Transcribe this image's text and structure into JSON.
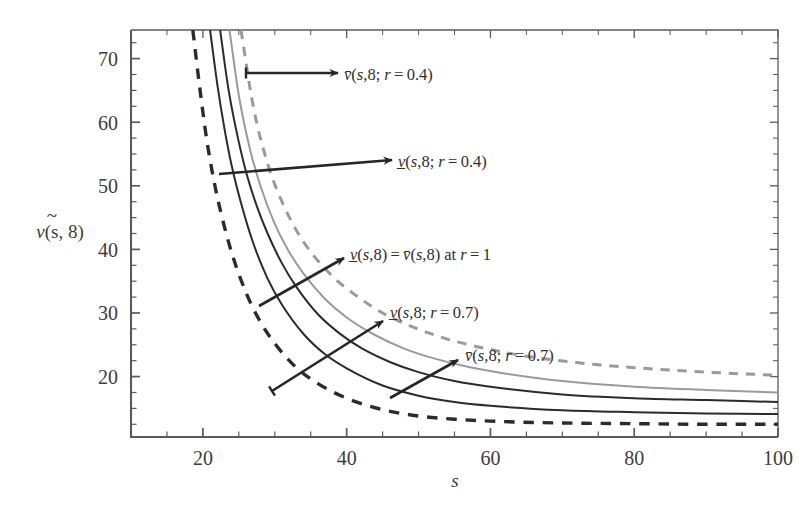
{
  "figure": {
    "background": "#ffffff",
    "frame_color": "#5a5a5a",
    "title": ""
  },
  "axes": {
    "x": {
      "label": "s",
      "min": 10,
      "max": 100,
      "ticks": [
        20,
        40,
        60,
        80,
        100
      ],
      "tick_labels": [
        "20",
        "40",
        "60",
        "80",
        "100"
      ],
      "minor_step": 5
    },
    "y": {
      "label_parts": {
        "sym": "v",
        "accent": "~",
        "args": "(s, 8)"
      },
      "label": "ṽ(s, 8)",
      "min": 10.5,
      "max": 74.5,
      "ticks": [
        20,
        30,
        40,
        50,
        60,
        70
      ],
      "tick_labels": [
        "20",
        "30",
        "40",
        "50",
        "60",
        "70"
      ],
      "minor_step": 2.5
    }
  },
  "colors": {
    "black": "#2b2b2b",
    "gray": "#9a9a9a",
    "frame": "#5a5a5a",
    "text": "#333333",
    "arrow": "#262626"
  },
  "chart_data": {
    "type": "line",
    "title": "",
    "xlabel": "s",
    "ylabel": "ṽ(s, 8)",
    "xlim": [
      10,
      100
    ],
    "ylim": [
      10.5,
      74.5
    ],
    "grid": false,
    "legend": "annotations",
    "series": [
      {
        "name": "v_lower(s,8; r=0.4)",
        "label": "v̲(s,8; r=0.4)",
        "style": "dashed",
        "color": "#2b2b2b",
        "width": 3.4,
        "asymptote": 12.4,
        "x_at_top": 18.6,
        "x": [
          18.6,
          19.5,
          20.5,
          21.5,
          22.5,
          24,
          26,
          28,
          30,
          33,
          36,
          40,
          45,
          50,
          55,
          60,
          70,
          80,
          90,
          100
        ],
        "y": [
          74.5,
          66.0,
          57.5,
          51.0,
          45.8,
          39.5,
          33.2,
          28.6,
          25.2,
          21.4,
          18.9,
          16.6,
          14.8,
          13.8,
          13.3,
          13.0,
          12.7,
          12.6,
          12.5,
          12.5
        ]
      },
      {
        "name": "v_lower(s,8; r=0.7)",
        "label": "v̲(s,8; r=0.7)",
        "style": "solid",
        "color": "#2b2b2b",
        "width": 2.0,
        "asymptote": 13.8,
        "x_at_top": 21.0,
        "x": [
          21.0,
          22.0,
          23.0,
          24.0,
          25.5,
          27,
          29,
          31,
          34,
          37,
          40,
          45,
          50,
          55,
          60,
          70,
          80,
          90,
          100
        ],
        "y": [
          74.5,
          66.0,
          59.0,
          53.2,
          46.5,
          41.0,
          35.4,
          31.3,
          26.7,
          23.5,
          21.3,
          18.6,
          17.0,
          16.0,
          15.4,
          14.7,
          14.4,
          14.2,
          14.1
        ]
      },
      {
        "name": "v_lower(s,8)=v_upper(s,8) at r=1",
        "label": "v̲(s,8) = v̄(s,8) at r = 1",
        "style": "solid",
        "color": "#2b2b2b",
        "width": 2.0,
        "asymptote": 14.7,
        "x_at_top": 22.4,
        "x": [
          22.4,
          23.5,
          24.5,
          26,
          27.5,
          29,
          31,
          33,
          36,
          39,
          42,
          46,
          50,
          55,
          60,
          70,
          80,
          90,
          100
        ],
        "y": [
          74.5,
          65.6,
          59.5,
          52.2,
          46.8,
          42.5,
          37.8,
          34.1,
          29.8,
          26.8,
          24.5,
          22.3,
          20.7,
          19.3,
          18.4,
          17.2,
          16.6,
          16.3,
          16.0
        ]
      },
      {
        "name": "v_upper(s,8; r=0.7)",
        "label": "v̄(s,8; r=0.7)",
        "style": "solid",
        "color": "#9a9a9a",
        "width": 2.0,
        "asymptote": 15.6,
        "x_at_top": 23.7,
        "x": [
          23.7,
          25,
          26.5,
          28,
          30,
          32,
          34,
          37,
          40,
          44,
          48,
          52,
          57,
          62,
          70,
          80,
          90,
          100
        ],
        "y": [
          74.5,
          64.2,
          56.0,
          50.0,
          44.0,
          39.6,
          36.2,
          32.2,
          29.3,
          26.5,
          24.4,
          22.9,
          21.5,
          20.5,
          19.3,
          18.4,
          17.9,
          17.5
        ]
      },
      {
        "name": "v_upper(s,8; r=0.4)",
        "label": "v̄(s,8; r=0.4)",
        "style": "dashed",
        "color": "#9a9a9a",
        "width": 3.0,
        "asymptote": 17.2,
        "x_at_top": 25.3,
        "x": [
          25.3,
          27,
          29,
          31,
          33,
          35,
          38,
          41,
          45,
          49,
          54,
          59,
          65,
          72,
          80,
          90,
          100
        ],
        "y": [
          74.5,
          62.5,
          53.5,
          47.5,
          43.0,
          39.6,
          35.8,
          33.0,
          30.0,
          27.9,
          25.9,
          24.5,
          23.2,
          22.2,
          21.4,
          20.7,
          20.2
        ]
      }
    ]
  },
  "annotations": [
    {
      "id": "ann-vbar-04",
      "text_html": "<tspan class='it'>v̄</tspan>(<tspan class='it'>s</tspan>,8; <tspan class='it'>r</tspan> = 0.4)",
      "text": "v̄(s,8; r=0.4)",
      "label_x": 344,
      "label_y": 80,
      "arrow": {
        "x1": 246,
        "y1": 73,
        "x2": 338,
        "y2": 73,
        "tail_tick": true
      }
    },
    {
      "id": "ann-vlow-04",
      "text_html": "<tspan class='it'>v̲</tspan>(<tspan class='it'>s</tspan>,8; <tspan class='it'>r</tspan> = 0.4)",
      "text": "v̲(s,8; r=0.4)",
      "label_x": 398,
      "label_y": 167,
      "arrow": {
        "x1": 219,
        "y1": 174,
        "x2": 392,
        "y2": 160,
        "tail_tick": false
      }
    },
    {
      "id": "ann-equal-r1",
      "text_html": "<tspan class='it'>v̲</tspan>(<tspan class='it'>s</tspan>,8) = <tspan class='it'>v̄</tspan>(<tspan class='it'>s</tspan>,8) at <tspan class='it'>r</tspan> = 1",
      "text": "v̲(s,8) = v̄(s,8) at r = 1",
      "label_x": 350,
      "label_y": 260,
      "arrow": {
        "x1": 259,
        "y1": 306,
        "x2": 344,
        "y2": 258,
        "tail_tick": false
      }
    },
    {
      "id": "ann-vlow-07",
      "text_html": "<tspan class='it'>v̲</tspan>(<tspan class='it'>s</tspan>,8; <tspan class='it'>r</tspan> = 0.7)",
      "text": "v̲(s,8; r=0.7)",
      "label_x": 390,
      "label_y": 318,
      "arrow": {
        "x1": 272,
        "y1": 391,
        "x2": 383,
        "y2": 321,
        "tail_tick": true
      }
    },
    {
      "id": "ann-vbar-07",
      "text_html": "<tspan class='it'>v̄</tspan>(<tspan class='it'>s</tspan>,8; <tspan class='it'>r</tspan> = 0.7)",
      "text": "v̄(s,8; r=0.7)",
      "label_x": 465,
      "label_y": 361,
      "arrow": {
        "x1": 390,
        "y1": 398,
        "x2": 458,
        "y2": 360,
        "tail_tick": false
      }
    }
  ],
  "plot_box": {
    "left": 131,
    "top": 30,
    "right": 778,
    "bottom": 437
  }
}
